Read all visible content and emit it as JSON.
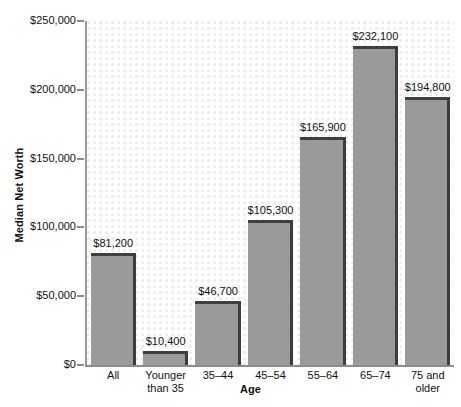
{
  "chart_data": {
    "type": "bar",
    "title": "",
    "xlabel": "Age",
    "ylabel": "Median Net Worth",
    "categories": [
      "All",
      "Younger than 35",
      "35–44",
      "45–54",
      "55–64",
      "65–74",
      "75 and older"
    ],
    "category_lines": [
      [
        "All"
      ],
      [
        "Younger",
        "than 35"
      ],
      [
        "35–44"
      ],
      [
        "45–54"
      ],
      [
        "55–64"
      ],
      [
        "65–74"
      ],
      [
        "75 and",
        "older"
      ]
    ],
    "values": [
      81200,
      10400,
      46700,
      105300,
      165900,
      232100,
      194800
    ],
    "value_labels": [
      "$81,200",
      "$10,400",
      "$46,700",
      "$105,300",
      "$165,900",
      "$232,100",
      "$194,800"
    ],
    "ylim": [
      0,
      250000
    ],
    "yticks": [
      0,
      50000,
      100000,
      150000,
      200000,
      250000
    ],
    "ytick_labels": [
      "$0",
      "$50,000",
      "$100,000",
      "$150,000",
      "$200,000",
      "$250,000"
    ],
    "grid": false,
    "legend": false,
    "bar_color": "#9a9a9a",
    "bar_edge_color": "#3f3f3f",
    "axis_color": "#8c8c8c",
    "background_color": "#ffffff",
    "dot_pattern_color": "#ececec"
  }
}
